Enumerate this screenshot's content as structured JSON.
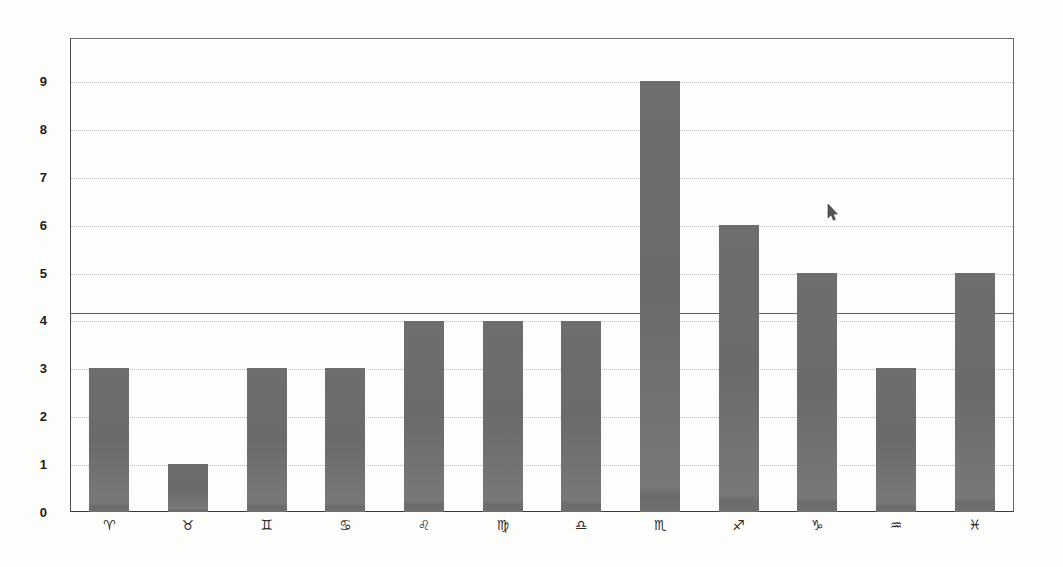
{
  "chart_data": {
    "type": "bar",
    "title": "",
    "subtitle": "",
    "xlabel": "",
    "ylabel": "",
    "categories": [
      "♈",
      "♉",
      "♊",
      "♋",
      "♌",
      "♍",
      "♎",
      "♏",
      "♐",
      "♑",
      "♒",
      "♓"
    ],
    "category_names": [
      "Aries",
      "Taurus",
      "Gemini",
      "Cancer",
      "Leo",
      "Virgo",
      "Libra",
      "Scorpio",
      "Sagittarius",
      "Capricorn",
      "Aquarius",
      "Pisces"
    ],
    "values": [
      3,
      1,
      3,
      3,
      4,
      4,
      4,
      9,
      6,
      5,
      3,
      5
    ],
    "ylim": [
      0,
      9.9
    ],
    "yticks": [
      0,
      1,
      2,
      3,
      4,
      5,
      6,
      7,
      8,
      9
    ],
    "ytick_labels": [
      "0",
      "1",
      "2",
      "3",
      "4",
      "5",
      "6",
      "7",
      "8",
      "9"
    ],
    "grid": true,
    "grid_axis": "y",
    "grid_style": "dotted",
    "legend": false,
    "legend_position": "none",
    "bar_color": "#6e6e6e",
    "grid_color": "#bcbcbc",
    "axis_color": "#3a3a3a",
    "background_color": "#fdfdfc",
    "reference_line": {
      "value": 4.17,
      "label": "",
      "color": "#5e5e5e",
      "style": "solid"
    }
  },
  "cursor": {
    "icon": "mouse-pointer-icon",
    "x": 827,
    "y": 204
  }
}
